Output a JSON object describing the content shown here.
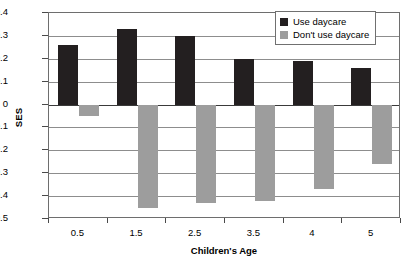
{
  "chart_data": {
    "type": "bar",
    "title": "",
    "xlabel": "Children's Age",
    "ylabel": "SES",
    "categories": [
      "0.5",
      "1.5",
      "2.5",
      "3.5",
      "4",
      "5"
    ],
    "series": [
      {
        "name": "Use daycare",
        "color": "#231f20",
        "values": [
          0.26,
          0.33,
          0.3,
          0.2,
          0.19,
          0.16
        ]
      },
      {
        "name": "Don't use daycare",
        "color": "#9d9d9d",
        "values": [
          -0.05,
          -0.45,
          -0.43,
          -0.42,
          -0.37,
          -0.26
        ]
      }
    ],
    "ylim": [
      -0.5,
      0.4
    ],
    "ytick_labels": [
      "0.4",
      "0.3",
      "0.2",
      "0.1",
      "0",
      "-0.1",
      "-0.2",
      "-0.3",
      "-0.4",
      "-0.5"
    ],
    "ytick_values": [
      0.4,
      0.3,
      0.2,
      0.1,
      0,
      -0.1,
      -0.2,
      -0.3,
      -0.4,
      -0.5
    ],
    "grid": true,
    "legend_position": "top-right"
  },
  "legend": {
    "entries": [
      {
        "label": "Use daycare"
      },
      {
        "label": "Don't use daycare"
      }
    ]
  }
}
